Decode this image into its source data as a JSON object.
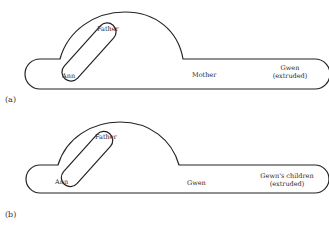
{
  "panels": [
    {
      "id": "a",
      "caption": "(a)",
      "labels": {
        "father": "Father",
        "ann": "Ann",
        "middle": "Mother",
        "right_line1": "Gwen",
        "right_line2": "(extruded)"
      }
    },
    {
      "id": "b",
      "caption": "(b)",
      "labels": {
        "father": "Father",
        "ann": "Ann",
        "middle": "Gwen",
        "right_line1": "Gewn's children",
        "right_line2": "(extruded)"
      }
    }
  ],
  "colors": {
    "stroke": "#222222",
    "background": "#ffffff"
  }
}
